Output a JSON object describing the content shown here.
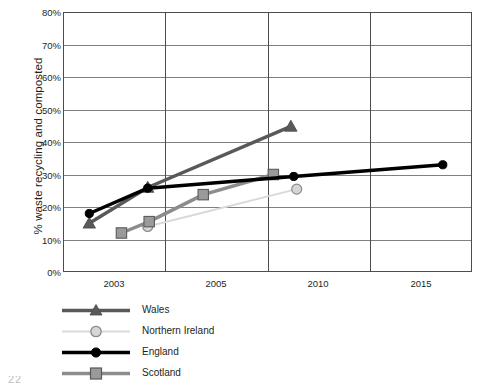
{
  "chart_data": {
    "type": "line",
    "title": "",
    "xlabel": "",
    "ylabel": "% waste recycling and composted",
    "ylim": [
      0,
      80
    ],
    "ytick_labels": [
      "0%",
      "10%",
      "20%",
      "30%",
      "40%",
      "50%",
      "60%",
      "70%",
      "80%"
    ],
    "ytick_values": [
      0,
      10,
      20,
      30,
      40,
      50,
      60,
      70,
      80
    ],
    "xtick_labels": [
      "2003",
      "2005",
      "2010",
      "2015"
    ],
    "xtick_values": [
      2003,
      2005,
      2010,
      2015
    ],
    "xlim": [
      2002.0,
      2016.0
    ],
    "grid": "horizontal-and-vertical",
    "legend_position": "below-left",
    "series": [
      {
        "name": "Wales",
        "color": "#595959",
        "marker": "triangle",
        "marker_fill": "#595959",
        "line_width": 3.5,
        "points": [
          {
            "x": 2002.9,
            "y": 15.0
          },
          {
            "x": 2004.9,
            "y": 26.0
          },
          {
            "x": 2009.8,
            "y": 44.8
          }
        ]
      },
      {
        "name": "Northern Ireland",
        "color": "#d9d9d9",
        "marker": "circle",
        "marker_fill": "#d6d6d6",
        "line_width": 2,
        "points": [
          {
            "x": 2004.9,
            "y": 14.0
          },
          {
            "x": 2010.0,
            "y": 25.5
          }
        ]
      },
      {
        "name": "England",
        "color": "#000000",
        "marker": "circle",
        "marker_fill": "#000000",
        "line_width": 3.5,
        "points": [
          {
            "x": 2002.9,
            "y": 18.0
          },
          {
            "x": 2004.9,
            "y": 25.8
          },
          {
            "x": 2009.9,
            "y": 29.4
          },
          {
            "x": 2015.0,
            "y": 33.0
          }
        ]
      },
      {
        "name": "Scotland",
        "color": "#8c8c8c",
        "marker": "square",
        "marker_fill": "#9a9a9a",
        "line_width": 3.5,
        "points": [
          {
            "x": 2004.0,
            "y": 12.0
          },
          {
            "x": 2004.95,
            "y": 15.5
          },
          {
            "x": 2006.8,
            "y": 23.8
          },
          {
            "x": 2009.2,
            "y": 30.0
          }
        ]
      }
    ]
  },
  "legend": {
    "items": [
      {
        "label": "Wales"
      },
      {
        "label": "Northern Ireland"
      },
      {
        "label": "England"
      },
      {
        "label": "Scotland"
      }
    ]
  },
  "footer": {
    "artifact_text": "22"
  }
}
